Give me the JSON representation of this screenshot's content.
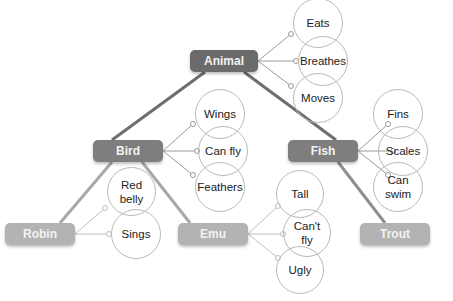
{
  "diagram": {
    "type": "concept-hierarchy",
    "nodes": {
      "animal": {
        "label": "Animal",
        "properties": [
          "Eats",
          "Breathes",
          "Moves"
        ]
      },
      "bird": {
        "label": "Bird",
        "properties": [
          "Wings",
          "Can fly",
          "Feathers"
        ]
      },
      "fish": {
        "label": "Fish",
        "properties": [
          "Fins",
          "Scales",
          "Can swim"
        ]
      },
      "robin": {
        "label": "Robin",
        "properties": [
          "Red belly",
          "Sings"
        ]
      },
      "emu": {
        "label": "Emu",
        "properties": [
          "Tall",
          "Can't fly",
          "Ugly"
        ]
      },
      "trout": {
        "label": "Trout",
        "properties": []
      }
    },
    "edges": [
      {
        "from": "Animal",
        "to": "Bird"
      },
      {
        "from": "Animal",
        "to": "Fish"
      },
      {
        "from": "Bird",
        "to": "Robin"
      },
      {
        "from": "Bird",
        "to": "Emu"
      },
      {
        "from": "Fish",
        "to": "Trout"
      }
    ],
    "colors": {
      "level0": "#6b6b6b",
      "level1": "#7e7e7e",
      "level2": "#b3b3b3",
      "circle_border": "#b8b8b8"
    }
  }
}
